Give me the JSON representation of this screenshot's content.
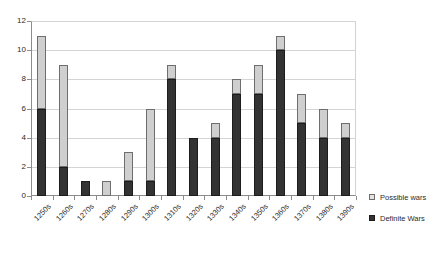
{
  "title_remnant": "",
  "legend": {
    "position": "right",
    "entries": [
      {
        "label": "Possible wars",
        "color": "#cfcfcf",
        "key": "possible"
      },
      {
        "label": "Definite Wars",
        "color": "#333333",
        "key": "definite"
      }
    ]
  },
  "axes": {
    "y_ticks": [
      "0",
      "2",
      "4",
      "6",
      "8",
      "10",
      "12"
    ],
    "ylim": [
      0,
      12
    ]
  },
  "chart_data": {
    "type": "bar",
    "stacked": true,
    "title": "",
    "xlabel": "",
    "ylabel": "",
    "ylim": [
      0,
      12
    ],
    "grid": true,
    "legend_position": "right",
    "categories": [
      "1250s",
      "1260s",
      "1270s",
      "1280s",
      "1290s",
      "1300s",
      "1310s",
      "1320s",
      "1330s",
      "1340s",
      "1350s",
      "1360s",
      "1370s",
      "1380s",
      "1390s"
    ],
    "series": [
      {
        "name": "Definite Wars",
        "color": "#333333",
        "values": [
          6,
          2,
          1,
          0,
          1,
          1,
          8,
          4,
          4,
          7,
          7,
          10,
          5,
          4,
          4
        ]
      },
      {
        "name": "Possible wars",
        "color": "#cfcfcf",
        "values": [
          5,
          7,
          0,
          1,
          2,
          5,
          1,
          0,
          1,
          1,
          2,
          1,
          2,
          2,
          1
        ]
      }
    ],
    "totals": [
      11,
      9,
      1,
      1,
      3,
      6,
      9,
      4,
      5,
      8,
      9,
      11,
      7,
      6,
      5
    ]
  }
}
